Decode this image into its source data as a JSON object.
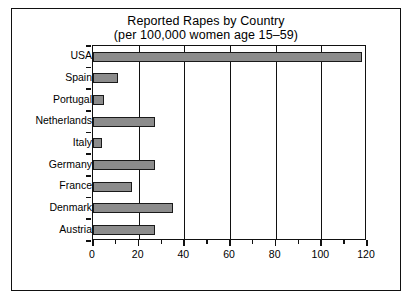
{
  "chart_data": {
    "type": "bar",
    "orientation": "horizontal",
    "title": "Reported Rapes by Country",
    "subtitle": "(per 100,000 women age 15–59)",
    "xlabel": "",
    "ylabel": "",
    "xlim": [
      0,
      120
    ],
    "ylim": null,
    "grid": true,
    "legend": null,
    "categories": [
      "USA",
      "Spain",
      "Portugal",
      "Netherlands",
      "Italy",
      "Germany",
      "France",
      "Denmark",
      "Austria"
    ],
    "values": [
      118,
      11,
      5,
      27,
      4,
      27,
      17,
      35,
      27
    ],
    "xticks": [
      0,
      20,
      40,
      60,
      80,
      100,
      120
    ],
    "xtick_labels": [
      "0",
      "20",
      "40",
      "60",
      "80",
      "100",
      "120"
    ],
    "xticks_minor": [
      10,
      30,
      50,
      70,
      90,
      110
    ],
    "bar_color": "#8c8c8c",
    "bar_edge_color": "#1a1a1a",
    "frame_color": "#111111",
    "background": "#ffffff"
  }
}
